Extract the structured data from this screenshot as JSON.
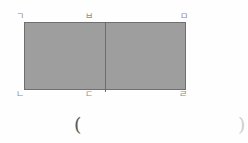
{
  "figure": {
    "type": "geometry-diagram",
    "shape": {
      "name": "rectangle",
      "fill_color": "#9e9e9e",
      "stroke_color": "#6f6f6f",
      "divider_color": "#6b6b6b"
    },
    "vertex_labels": {
      "top_left": "ㄱ",
      "top_middle": "ㅂ",
      "top_right": "ㅁ",
      "bottom_left": "ㄴ",
      "bottom_middle": "ㄷ",
      "bottom_right": "ㄹ"
    },
    "caption": {
      "open_paren": "(",
      "close_paren": ")"
    }
  }
}
